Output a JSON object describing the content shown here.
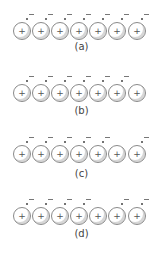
{
  "diagram": {
    "atom_symbol": "+",
    "electron_symbol": "-",
    "panels": [
      {
        "label": "(a)",
        "electrons": [
          true,
          true,
          true,
          true,
          true,
          true,
          true
        ]
      },
      {
        "label": "(b)",
        "electrons": [
          true,
          true,
          true,
          true,
          true,
          true,
          false
        ]
      },
      {
        "label": "(c)",
        "electrons": [
          true,
          true,
          true,
          true,
          true,
          false,
          true
        ]
      },
      {
        "label": "(d)",
        "electrons": [
          true,
          true,
          true,
          true,
          false,
          true,
          true
        ]
      }
    ]
  }
}
